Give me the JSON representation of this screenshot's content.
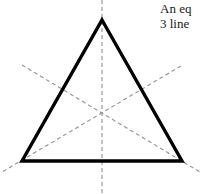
{
  "figure": {
    "background_color": "#ffffff",
    "canvas": {
      "width": 202,
      "height": 194
    },
    "caption": {
      "lines": [
        "An eq",
        "3 line"
      ],
      "color": "#1a1a1a",
      "clipped_at_right_edge": true
    },
    "shape": {
      "name": "equilateral triangle",
      "stroke_color": "#000000",
      "stroke_width": 3.4,
      "fill": "none",
      "vertices": [
        {
          "label": "apex",
          "x": 102,
          "y": 20
        },
        {
          "label": "bottom-right",
          "x": 182,
          "y": 161
        },
        {
          "label": "bottom-left",
          "x": 22,
          "y": 161
        }
      ]
    },
    "symmetry_lines": {
      "count": 3,
      "stroke_color": "#9a9a9a",
      "stroke_width": 1.2,
      "dash_pattern": "4 3",
      "centroid": {
        "x": 102,
        "y": 113
      },
      "lines": [
        {
          "name": "vertical-axis",
          "from": {
            "x": 102,
            "y": 0
          },
          "to": {
            "x": 102,
            "y": 194
          }
        },
        {
          "name": "left-diagonal-axis",
          "from": {
            "x": 22,
            "y": 65
          },
          "to": {
            "x": 200,
            "y": 172
          }
        },
        {
          "name": "right-diagonal-axis",
          "from": {
            "x": 181,
            "y": 66
          },
          "to": {
            "x": 2,
            "y": 172
          }
        }
      ]
    }
  }
}
